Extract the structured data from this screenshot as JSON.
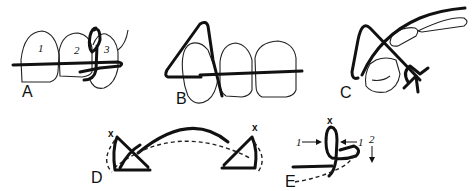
{
  "figure": {
    "panels": [
      {
        "id": "A",
        "label": "A",
        "tooth_numbers": [
          "1",
          "2",
          "3"
        ]
      },
      {
        "id": "B",
        "label": "B"
      },
      {
        "id": "C",
        "label": "C"
      },
      {
        "id": "D",
        "label": "D",
        "marks": [
          "x",
          "x"
        ]
      },
      {
        "id": "E",
        "label": "E",
        "mark": "x",
        "arrow_labels": [
          "1",
          "1",
          "2"
        ]
      }
    ]
  }
}
